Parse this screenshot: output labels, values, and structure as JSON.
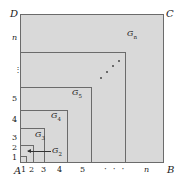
{
  "figure": {
    "corners": {
      "A": "A",
      "B": "B",
      "C": "C",
      "D": "D"
    },
    "x_ticks": [
      "1",
      "2",
      "3",
      "4",
      "5",
      "n"
    ],
    "y_ticks": [
      "1",
      "2",
      "3",
      "4",
      "5",
      "n"
    ],
    "x_ellipsis": "· · ·",
    "y_ellipsis": "⋮",
    "regions": [
      {
        "label": "G",
        "sub": "2"
      },
      {
        "label": "G",
        "sub": "3"
      },
      {
        "label": "G",
        "sub": "4"
      },
      {
        "label": "G",
        "sub": "5"
      },
      {
        "label": "G",
        "sub": "n"
      }
    ],
    "colors": {
      "fill": "#d9d9d9",
      "stroke": "#6b6b6b",
      "text": "#1a1a1a"
    }
  }
}
